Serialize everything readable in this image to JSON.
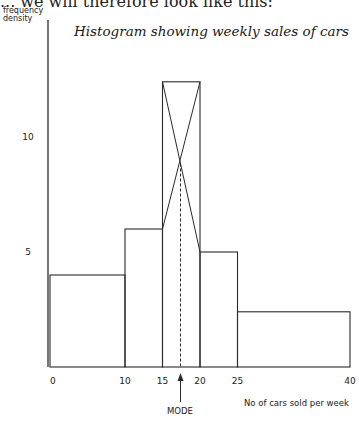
{
  "page": {
    "cut_off_text": "... we will therefore look like this:"
  },
  "chart_data": {
    "type": "bar",
    "subtype": "histogram",
    "title": "Histogram showing weekly sales of cars",
    "xlabel": "No of cars sold per week",
    "ylabel": "frequency density",
    "ylabel_lines": [
      "frequency",
      "density"
    ],
    "bins": [
      {
        "from": 0,
        "to": 10,
        "frequency_density": 4
      },
      {
        "from": 10,
        "to": 15,
        "frequency_density": 6
      },
      {
        "from": 15,
        "to": 20,
        "frequency_density": 12.4
      },
      {
        "from": 20,
        "to": 25,
        "frequency_density": 5
      },
      {
        "from": 25,
        "to": 40,
        "frequency_density": 2.4
      }
    ],
    "categories": [
      "0-10",
      "10-15",
      "15-20",
      "20-25",
      "25-40"
    ],
    "values": [
      4,
      6,
      12.4,
      5,
      2.4
    ],
    "x_ticks": [
      0,
      10,
      15,
      20,
      25,
      40
    ],
    "y_ticks": [
      5,
      10
    ],
    "xlim": [
      0,
      40
    ],
    "ylim": [
      0,
      15
    ],
    "grid": false,
    "annotations": [
      {
        "type": "crossed-lines-in-modal-bar",
        "description": "Diagonals drawn from top corners of the modal class to adjacent bar tops"
      },
      {
        "type": "dashed-vertical-line",
        "x": 17.4,
        "description": "From diagonal intersection down to x-axis"
      },
      {
        "type": "arrow",
        "x": 17.4,
        "label": "MODE"
      }
    ],
    "mode_estimate": 17.4
  }
}
